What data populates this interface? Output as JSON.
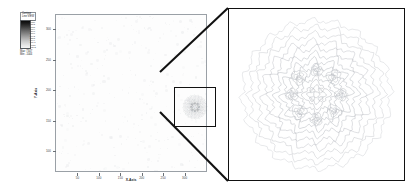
{
  "figure": {
    "type": "contour-intensity-plot-with-magnified-inset",
    "background_color": "#ffffff",
    "accent_color": "#111111"
  },
  "colorbar": {
    "name": "colorbar-legend",
    "title": "Contour\nLine VIEW",
    "orientation": "vertical",
    "gradient": "grayscale-dark-to-light",
    "high_color": "#0a0a0a",
    "low_color": "#f4f4f4",
    "ticks": [
      "7710",
      "7036",
      "6362",
      "5688",
      "5014",
      "4340",
      "3666",
      "2992",
      "2318",
      "1644",
      "970.1",
      "-4011",
      "-1342"
    ],
    "max_label": "Max: 7347",
    "min_label": "Min: -1044"
  },
  "main_plot": {
    "name": "main-contour-plot",
    "x_axis_title": "X-Axis",
    "y_axis_title": "Y-Axis",
    "x_ticks": [
      "50",
      "100",
      "150",
      "200",
      "250",
      "300"
    ],
    "y_ticks": [
      "300",
      "250",
      "200",
      "150",
      "100"
    ],
    "roi_label": "region-of-interest"
  },
  "inset": {
    "name": "magnified-inset-panel",
    "description": "Magnified contour detail of region of interest"
  },
  "chart_data": {
    "type": "heatmap",
    "title": "Contour Line VIEW",
    "xlabel": "X-Axis",
    "ylabel": "Y-Axis",
    "xlim": [
      0,
      330
    ],
    "ylim": [
      70,
      330
    ],
    "x_tick_values": [
      50,
      100,
      150,
      200,
      250,
      300
    ],
    "y_tick_values": [
      300,
      250,
      200,
      150,
      100
    ],
    "grid": false,
    "legend": "colorbar-left",
    "colorbar_range": [
      -1044,
      7347
    ],
    "colorbar_levels": [
      7710,
      7036,
      6362,
      5688,
      5014,
      4340,
      3666,
      2992,
      2318,
      1644,
      970.1,
      -401.1,
      -1342
    ],
    "roi": {
      "x": [
        150,
        200
      ],
      "y": [
        180,
        230
      ],
      "magnified": true
    },
    "note": "Radially symmetric concentric contour structure centred in region of interest; diffuse low-amplitude background elsewhere"
  }
}
